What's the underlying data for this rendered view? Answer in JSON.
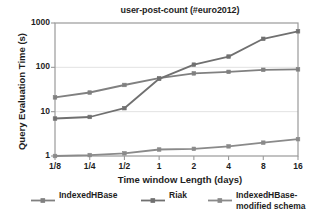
{
  "chart_data": {
    "type": "line",
    "title": "user-post-count (#euro2012)",
    "xlabel": "Time window Length (days)",
    "ylabel": "Query Evaluation Time (s)",
    "x_tick_labels": [
      "1/8",
      "1/4",
      "1/2",
      "1",
      "2",
      "4",
      "8",
      "16"
    ],
    "categories": [
      "1/8",
      "1/4",
      "1/2",
      "1",
      "2",
      "4",
      "8",
      "16"
    ],
    "y_tick_labels": [
      "1",
      "10",
      "100",
      "1000"
    ],
    "y_scale": "log",
    "ylim": [
      1,
      1000
    ],
    "grid": "horizontal",
    "legend_position": "bottom",
    "series": [
      {
        "name": "IndexedHBase",
        "color": "#808080",
        "values": [
          21,
          27,
          40,
          57,
          73,
          79,
          88,
          90
        ]
      },
      {
        "name": "Riak",
        "color": "#707070",
        "values": [
          7.0,
          7.6,
          12,
          55,
          115,
          175,
          440,
          650
        ]
      },
      {
        "name": "IndexedHBase-\nmodified schema",
        "color": "#8a8a8a",
        "values": [
          1.0,
          1.05,
          1.15,
          1.4,
          1.45,
          1.65,
          2.0,
          2.4
        ]
      }
    ]
  },
  "legend": {
    "items": [
      {
        "label": "IndexedHBase"
      },
      {
        "label": "Riak"
      },
      {
        "label": "IndexedHBase-\nmodified schema"
      }
    ]
  }
}
